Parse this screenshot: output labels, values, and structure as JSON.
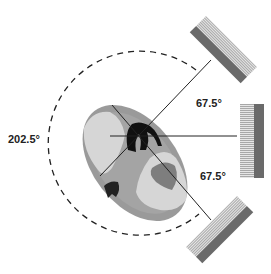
{
  "diagram": {
    "type": "radiotherapy beam arrangement",
    "labels": {
      "arc_angle": "202.5°",
      "upper_angle": "67.5°",
      "lower_angle": "67.5°"
    },
    "colors": {
      "body_outline": "#8a8a8a",
      "lung": "#d4d4d4",
      "tissue": "#9c9c9c",
      "heart": "#7a7a7a",
      "spine": "#111111",
      "detector_dark": "#6a6a6a",
      "detector_hatch": "#bdbdbd",
      "beam_line": "#222222"
    },
    "detectors": [
      "top-right detector",
      "right detector",
      "bottom-right detector"
    ]
  }
}
